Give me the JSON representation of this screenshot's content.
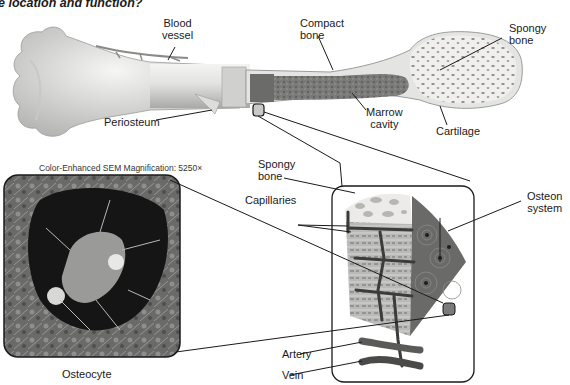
{
  "figure": {
    "title": "e location and function?",
    "labels": {
      "blood_vessel": [
        "Blood",
        "vessel"
      ],
      "compact_bone": [
        "Compact",
        "bone"
      ],
      "spongy_bone_top": [
        "Spongy",
        "bone"
      ],
      "periosteum": "Periosteum",
      "marrow_cavity": [
        "Marrow",
        "cavity"
      ],
      "cartilage": "Cartilage",
      "spongy_bone_inset": [
        "Spongy",
        "bone"
      ],
      "capillaries": "Capillaries",
      "osteon_system": [
        "Osteon",
        "system"
      ],
      "artery": "Artery",
      "vein": "Vein",
      "osteocyte": "Osteocyte"
    },
    "sem_caption": "Color-Enhanced SEM Magnification: 5250×",
    "colors": {
      "bone_light": "#e6e6e4",
      "bone_shade": "#b8b8b6",
      "marrow": "#6f6f6d",
      "spongy_fill": "#efeeec",
      "osteon_dark": "#5e5e5c",
      "compact_slice": "#a9a9a7",
      "vessel": "#4a4a4a",
      "line": "#1a1a1a"
    }
  }
}
